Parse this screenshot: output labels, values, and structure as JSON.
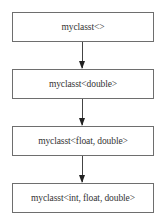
{
  "diagram": {
    "type": "flowchart",
    "direction": "top-to-bottom",
    "nodes": [
      {
        "id": "n1",
        "label": "myclasst<>"
      },
      {
        "id": "n2",
        "label": "myclasst<double>"
      },
      {
        "id": "n3",
        "label": "myclasst<float, double>"
      },
      {
        "id": "n4",
        "label": "myclasst<int, float, double>"
      }
    ],
    "edges": [
      {
        "from": "n1",
        "to": "n2"
      },
      {
        "from": "n2",
        "to": "n3"
      },
      {
        "from": "n3",
        "to": "n4"
      }
    ],
    "colors": {
      "border": "#6e6e6e",
      "arrow": "#222222",
      "text": "#333333",
      "background": "#ffffff"
    }
  }
}
